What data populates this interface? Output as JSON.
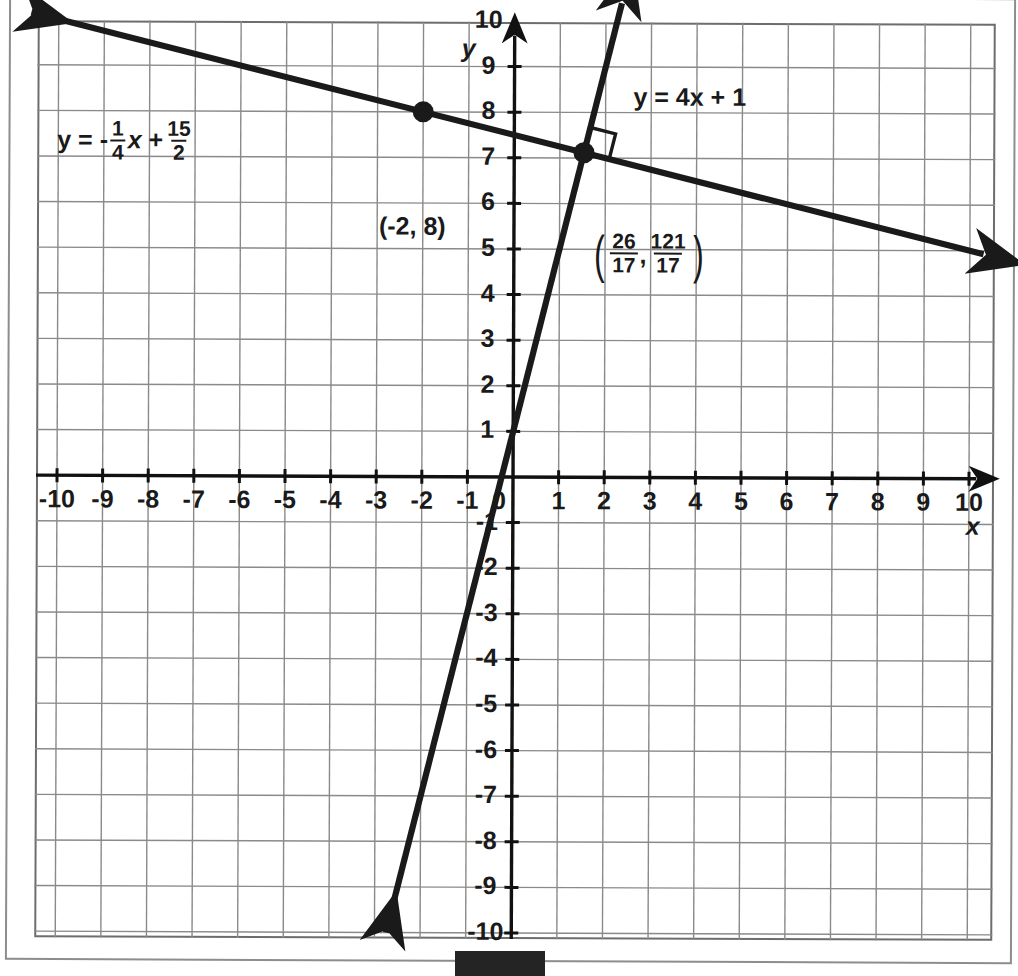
{
  "figure": {
    "kind": "coordinate-plane-graph",
    "background": "#ffffff",
    "grid_color": "#8a8a8a",
    "axis_color": "#111111",
    "line_color": "#1a1a1a"
  },
  "axes": {
    "x_axis_label": "x",
    "y_axis_label": "y",
    "x_ticks": [
      "-10",
      "-9",
      "-8",
      "-7",
      "-6",
      "-5",
      "-4",
      "-3",
      "-2",
      "-1",
      "0",
      "1",
      "2",
      "3",
      "4",
      "5",
      "6",
      "7",
      "8",
      "9",
      "10"
    ],
    "y_ticks_positive": [
      "10",
      "9",
      "8",
      "7",
      "6",
      "5",
      "4",
      "3",
      "2",
      "1"
    ],
    "y_ticks_negative": [
      "-1",
      "-2",
      "-3",
      "-4",
      "-5",
      "-6",
      "-7",
      "-8",
      "-9",
      "-10"
    ],
    "origin_label": "0",
    "xlim": [
      -10.6,
      10.3
    ],
    "ylim": [
      -10.6,
      10.6
    ]
  },
  "equations": {
    "shallow_line": {
      "prefix": "y = -",
      "numerator": "1",
      "denominator": "4",
      "variable": "x",
      "plus": "+",
      "numerator2": "15",
      "denominator2": "2",
      "slope": -0.25,
      "intercept": 7.5
    },
    "steep_line": {
      "text": "y = 4x + 1",
      "slope": 4,
      "intercept": 1
    }
  },
  "points": [
    {
      "label": "(-2, 8)",
      "x": -2,
      "y": 8,
      "marked": true
    },
    {
      "label_open_paren": "(",
      "label_close_paren": ")",
      "num_x": "26",
      "den_x": "17",
      "comma": ",",
      "num_y": "121",
      "den_y": "17",
      "x": 1.529,
      "y": 7.118,
      "marked": true
    }
  ],
  "annotations": {
    "right_angle_marker": "perpendicular lines right-angle square at intersection"
  },
  "chart_data": {
    "type": "line",
    "title": "",
    "xlabel": "x",
    "ylabel": "y",
    "xlim": [
      -10.6,
      10.3
    ],
    "ylim": [
      -10.6,
      10.6
    ],
    "grid": true,
    "legend": "inline-labels",
    "series": [
      {
        "name": "y = -1/4 x + 15/2",
        "slope": -0.25,
        "intercept": 7.5,
        "arrows": [
          "left",
          "right"
        ],
        "x": [
          -10.6,
          10.3
        ],
        "y": [
          10.15,
          4.925
        ]
      },
      {
        "name": "y = 4x + 1",
        "slope": 4,
        "intercept": 1,
        "arrows": [
          "up",
          "down"
        ],
        "x": [
          -2.75,
          2.35
        ],
        "y": [
          -10.0,
          10.4
        ]
      }
    ],
    "annotated_points": [
      {
        "label": "(-2, 8)",
        "x": -2,
        "y": 8
      },
      {
        "label": "(26/17, 121/17)",
        "x": 1.529,
        "y": 7.118
      }
    ]
  }
}
